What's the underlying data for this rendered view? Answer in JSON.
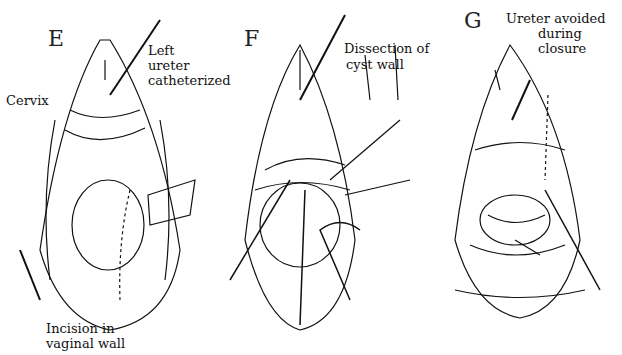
{
  "figure": {
    "panels": [
      {
        "letter": "E",
        "labels": {
          "left_ureter_line1": "Left",
          "left_ureter_line2": "ureter",
          "left_ureter_line3": "catheterized",
          "cervix": "Cervix",
          "incision_line1": "Incision in",
          "incision_line2": "vaginal wall"
        }
      },
      {
        "letter": "F",
        "labels": {
          "dissection_line1": "Dissection of",
          "dissection_line2": "cyst wall"
        }
      },
      {
        "letter": "G",
        "labels": {
          "ureter_line1": "Ureter avoided",
          "ureter_line2": "during",
          "ureter_line3": "closure"
        }
      }
    ]
  }
}
